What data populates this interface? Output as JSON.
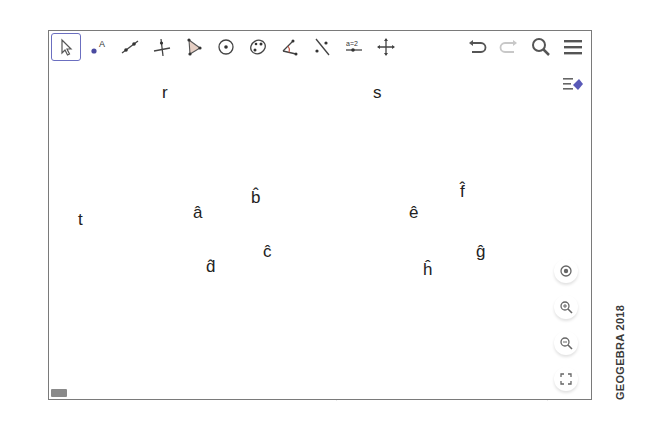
{
  "toolbar": {
    "tools": [
      {
        "name": "move-tool",
        "label": "Move"
      },
      {
        "name": "point-tool",
        "label": "A"
      },
      {
        "name": "line-tool",
        "label": "Line"
      },
      {
        "name": "perpendicular-line-tool",
        "label": "Perpendicular Line"
      },
      {
        "name": "polygon-tool",
        "label": "Polygon"
      },
      {
        "name": "circle-center-tool",
        "label": "Circle with Center"
      },
      {
        "name": "conic-tool",
        "label": "Conic through 5 Points"
      },
      {
        "name": "angle-tool",
        "label": "Angle"
      },
      {
        "name": "reflect-tool",
        "label": "Reflect about Line"
      },
      {
        "name": "slider-tool",
        "label": "a=2"
      },
      {
        "name": "move-graphics-tool",
        "label": "Move Graphics View"
      }
    ],
    "selected_index": 0,
    "right": [
      "undo",
      "redo",
      "search",
      "menu"
    ]
  },
  "canvas": {
    "lines": {
      "t": {
        "label": "t"
      },
      "r": {
        "label": "r"
      },
      "s": {
        "label": "s"
      }
    },
    "intersection_1": {
      "angles": [
        {
          "label": "â",
          "color": "#f2c074"
        },
        {
          "label": "b̂",
          "color": "#a9a9e6"
        },
        {
          "label": "ĉ",
          "color": "#f08a62"
        },
        {
          "label": "d̂",
          "color": "#b6e0a0"
        }
      ]
    },
    "intersection_2": {
      "angles": [
        {
          "label": "ê",
          "color": "#f2c074"
        },
        {
          "label": "f̂",
          "color": "#a9a9e6"
        },
        {
          "label": "ĝ",
          "color": "#f08a62"
        },
        {
          "label": "ĥ",
          "color": "#b6e0a0"
        }
      ]
    },
    "arc_strokes": {
      "top_right": "#6a6ad0",
      "bottom_right": "#e0603a",
      "bottom_left": "#7cc060",
      "top_left": "#e8a848"
    }
  },
  "zoom_controls": [
    "standard-view",
    "zoom-in",
    "zoom-out",
    "fullscreen"
  ],
  "watermark": "GEOGEBRA 2018"
}
